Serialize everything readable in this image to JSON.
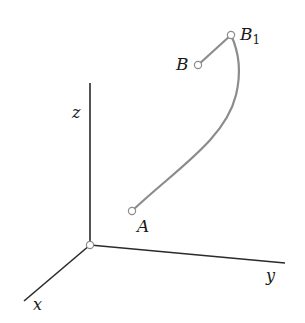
{
  "diagram": {
    "axes": {
      "x_label": "x",
      "y_label": "y",
      "z_label": "z"
    },
    "points": {
      "A": "A",
      "B": "B",
      "B1_base": "B",
      "B1_sub": "1"
    },
    "colors": {
      "axis": "#2a2a2a",
      "path": "#8c8c8c",
      "point_fill": "#ffffff",
      "point_stroke": "#8c8c8c"
    }
  }
}
